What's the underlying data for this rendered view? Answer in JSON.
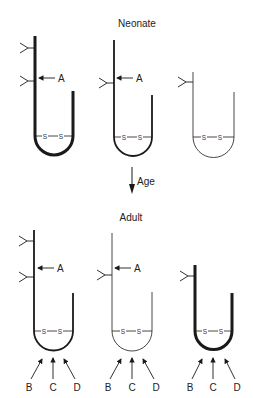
{
  "diagram": {
    "sections": [
      {
        "title": "Neonate"
      },
      {
        "title": "Adult"
      }
    ],
    "transition": {
      "label": "Age",
      "direction": "down"
    },
    "marker_labels": {
      "a": "A",
      "b": "B",
      "c": "C",
      "d": "D",
      "disulfide_left": "S",
      "disulfide_right": "S"
    },
    "molecules": {
      "neonate": [
        {
          "id": "neonate-1",
          "stroke": "heavy",
          "carbohydrates": 2,
          "label_a": true
        },
        {
          "id": "neonate-2",
          "stroke": "medium",
          "carbohydrates": 1,
          "label_a": true
        },
        {
          "id": "neonate-3",
          "stroke": "thin",
          "carbohydrates": 1,
          "label_a": false
        }
      ],
      "adult": [
        {
          "id": "adult-1",
          "stroke": "medium",
          "carbohydrates": 2,
          "label_a": true,
          "arrows": [
            "B",
            "C",
            "D"
          ]
        },
        {
          "id": "adult-2",
          "stroke": "thin",
          "carbohydrates": 1,
          "label_a": true,
          "arrows": [
            "B",
            "C",
            "D"
          ]
        },
        {
          "id": "adult-3",
          "stroke": "heavy",
          "carbohydrates": 1,
          "label_a": false,
          "arrows": [
            "B",
            "C",
            "D"
          ]
        }
      ]
    },
    "colors": {
      "line": "#1a1a1a",
      "background": "#ffffff"
    }
  }
}
